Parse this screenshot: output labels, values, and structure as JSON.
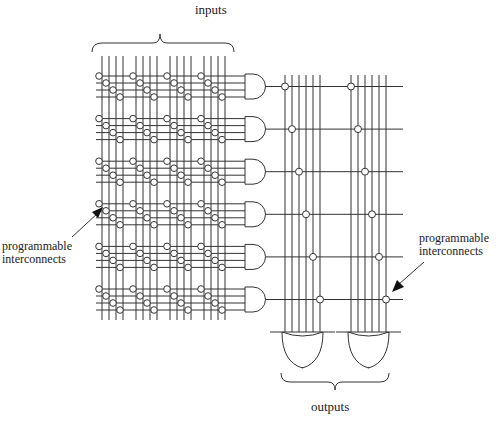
{
  "labels": {
    "inputs": "inputs",
    "outputs": "outputs",
    "left_annotation_line1": "programmable",
    "left_annotation_line2": "interconnects",
    "right_annotation_line1": "programmable",
    "right_annotation_line2": "interconnects"
  },
  "structure": {
    "input_groups": 4,
    "lines_per_input_group": 4,
    "product_terms": 6,
    "and_gate_inputs": 4,
    "or_gates": 2,
    "or_gate_inputs": 6
  },
  "colors": {
    "line": "#333333",
    "node_fill": "#ffffff",
    "text": "#222222"
  }
}
